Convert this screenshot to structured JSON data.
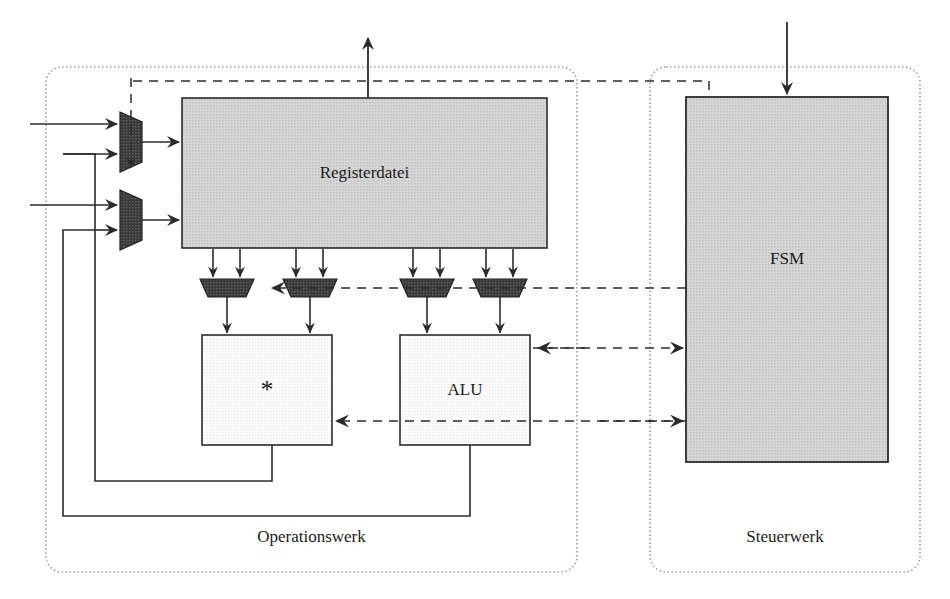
{
  "diagram": {
    "type": "block-diagram",
    "groups": [
      {
        "id": "operationswerk",
        "label": "Operationswerk",
        "border": "dotted",
        "x": 46,
        "y": 67,
        "w": 531,
        "h": 505
      },
      {
        "id": "steuerwerk",
        "label": "Steuerwerk",
        "border": "dotted",
        "x": 650,
        "y": 67,
        "w": 270,
        "h": 505
      }
    ],
    "blocks": [
      {
        "id": "registerdatei",
        "label": "Registerdatei",
        "x": 182,
        "y": 98,
        "w": 365,
        "h": 150,
        "fill": "#d4d4d4"
      },
      {
        "id": "multiplier",
        "label": "*",
        "x": 202,
        "y": 335,
        "w": 130,
        "h": 110,
        "fill": "#fbfbfb"
      },
      {
        "id": "alu",
        "label": "ALU",
        "x": 400,
        "y": 335,
        "w": 130,
        "h": 110,
        "fill": "#fbfbfb"
      },
      {
        "id": "fsm",
        "label": "FSM",
        "x": 686,
        "y": 97,
        "w": 202,
        "h": 365,
        "fill": "#d4d4d4"
      }
    ],
    "muxes_input": [
      {
        "id": "write-port-mux-1",
        "x": 120,
        "y": 110,
        "w": 22,
        "h": 60,
        "orientation": "vertical",
        "fill": "#3b3b3b"
      },
      {
        "id": "write-port-mux-2",
        "x": 120,
        "y": 188,
        "w": 22,
        "h": 60,
        "orientation": "vertical",
        "fill": "#3b3b3b"
      }
    ],
    "muxes_operand": [
      {
        "id": "operand-mux-a1",
        "x": 200,
        "y": 279,
        "w": 54,
        "h": 18,
        "fill": "#3b3b3b"
      },
      {
        "id": "operand-mux-a2",
        "x": 283,
        "y": 279,
        "w": 54,
        "h": 18,
        "fill": "#3b3b3b"
      },
      {
        "id": "operand-mux-b1",
        "x": 400,
        "y": 279,
        "w": 54,
        "h": 18,
        "fill": "#3b3b3b"
      },
      {
        "id": "operand-mux-b2",
        "x": 473,
        "y": 279,
        "w": 54,
        "h": 18,
        "fill": "#3b3b3b"
      }
    ],
    "colors": {
      "line": "#2b2b2b",
      "block_fill_dark": "#d4d4d4",
      "block_fill_light": "#fbfbfb",
      "mux_fill": "#3b3b3b",
      "group_border": "#9a9a9a",
      "background": "#ffffff"
    },
    "signals": {
      "data_style": "solid",
      "control_style": "dashed",
      "group_style": "dotted"
    }
  }
}
